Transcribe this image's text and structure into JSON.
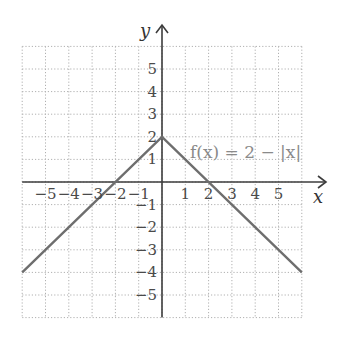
{
  "chart_data": {
    "type": "line",
    "title": "",
    "xlabel": "x",
    "ylabel": "y",
    "xlim": [
      -6,
      6
    ],
    "ylim": [
      -6,
      6
    ],
    "grid": true,
    "grid_style": "dotted",
    "x_ticks": [
      -5,
      -4,
      -3,
      -2,
      -1,
      1,
      2,
      3,
      4,
      5
    ],
    "x_tick_labels": [
      "−5",
      "−4",
      "−3",
      "−2",
      "−1",
      "1",
      "2",
      "3",
      "4",
      "5"
    ],
    "y_ticks": [
      5,
      4,
      3,
      2,
      1,
      -1,
      -2,
      -3,
      -4,
      -5
    ],
    "y_tick_labels": [
      "5",
      "4",
      "3",
      "2",
      "1",
      "−1",
      "−2",
      "−3",
      "−4",
      "−5"
    ],
    "series": [
      {
        "name": "f(x) = 2 − |x|",
        "x": [
          -6,
          0,
          6
        ],
        "y": [
          -4,
          2,
          -4
        ],
        "color": "#6e6e6e"
      }
    ],
    "annotations": [
      {
        "text": "f(x) = 2 − |x|",
        "x": 0.6,
        "y": 1.4
      }
    ]
  },
  "labels": {
    "x_axis": "x",
    "y_axis": "y",
    "function": "f(x) = 2 − |x|"
  },
  "colors": {
    "axis": "#3c3c3c",
    "grid": "#b0b0b0",
    "line": "#6e6e6e",
    "tick_text": "#4a4a4a",
    "function_label": "#8a8a8a"
  }
}
